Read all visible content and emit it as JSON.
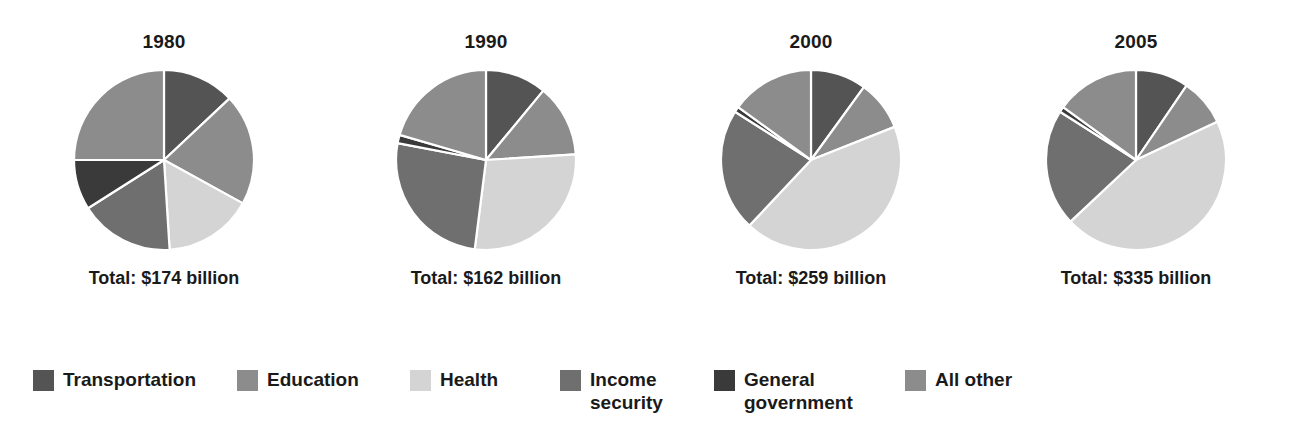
{
  "chart_data": {
    "type": "pie",
    "title": "",
    "subtitle": "",
    "xlabel": "",
    "ylabel": "",
    "legend_position": "bottom",
    "grid": false,
    "categories": [
      "Transportation",
      "Education",
      "Health",
      "Income security",
      "General government",
      "All other"
    ],
    "colors": [
      "#545454",
      "#8c8c8c",
      "#d4d4d4",
      "#6f6f6f",
      "#3a3a3a",
      "#8c8c8c"
    ],
    "panels": [
      {
        "year": "1980",
        "total_label": "Total: $174 billion",
        "total_value": 174,
        "total_units": "billion dollars",
        "values": [
          13.0,
          20.0,
          16.0,
          17.0,
          9.0,
          25.0
        ],
        "slices": [
          {
            "name": "Transportation",
            "percent": 13.0,
            "color": "#545454"
          },
          {
            "name": "Education",
            "percent": 20.0,
            "color": "#8c8c8c"
          },
          {
            "name": "Health",
            "percent": 16.0,
            "color": "#d4d4d4"
          },
          {
            "name": "Income security",
            "percent": 17.0,
            "color": "#6f6f6f"
          },
          {
            "name": "General government",
            "percent": 9.0,
            "color": "#3a3a3a"
          },
          {
            "name": "All other",
            "percent": 25.0,
            "color": "#8c8c8c"
          }
        ]
      },
      {
        "year": "1990",
        "total_label": "Total: $162 billion",
        "total_value": 162,
        "total_units": "billion dollars",
        "values": [
          11.0,
          13.0,
          28.0,
          26.0,
          1.5,
          20.5
        ],
        "slices": [
          {
            "name": "Transportation",
            "percent": 11.0,
            "color": "#545454"
          },
          {
            "name": "Education",
            "percent": 13.0,
            "color": "#8c8c8c"
          },
          {
            "name": "Health",
            "percent": 28.0,
            "color": "#d4d4d4"
          },
          {
            "name": "Income security",
            "percent": 26.0,
            "color": "#6f6f6f"
          },
          {
            "name": "General government",
            "percent": 1.5,
            "color": "#3a3a3a"
          },
          {
            "name": "All other",
            "percent": 20.5,
            "color": "#8c8c8c"
          }
        ]
      },
      {
        "year": "2000",
        "total_label": "Total: $259 billion",
        "total_value": 259,
        "total_units": "billion dollars",
        "values": [
          10.0,
          9.0,
          43.0,
          22.0,
          1.0,
          15.0
        ],
        "slices": [
          {
            "name": "Transportation",
            "percent": 10.0,
            "color": "#545454"
          },
          {
            "name": "Education",
            "percent": 9.0,
            "color": "#8c8c8c"
          },
          {
            "name": "Health",
            "percent": 43.0,
            "color": "#d4d4d4"
          },
          {
            "name": "Income security",
            "percent": 22.0,
            "color": "#6f6f6f"
          },
          {
            "name": "General government",
            "percent": 1.0,
            "color": "#3a3a3a"
          },
          {
            "name": "All other",
            "percent": 15.0,
            "color": "#8c8c8c"
          }
        ]
      },
      {
        "year": "2005",
        "total_label": "Total: $335 billion",
        "total_value": 335,
        "total_units": "billion dollars",
        "values": [
          9.5,
          8.5,
          45.0,
          21.0,
          1.0,
          15.0
        ],
        "slices": [
          {
            "name": "Transportation",
            "percent": 9.5,
            "color": "#545454"
          },
          {
            "name": "Education",
            "percent": 8.5,
            "color": "#8c8c8c"
          },
          {
            "name": "Health",
            "percent": 45.0,
            "color": "#d4d4d4"
          },
          {
            "name": "Income security",
            "percent": 21.0,
            "color": "#6f6f6f"
          },
          {
            "name": "General government",
            "percent": 1.0,
            "color": "#3a3a3a"
          },
          {
            "name": "All other",
            "percent": 15.0,
            "color": "#8c8c8c"
          }
        ]
      }
    ],
    "legend": [
      {
        "label": "Transportation",
        "color": "#545454",
        "x": 33
      },
      {
        "label": "Education",
        "color": "#8c8c8c",
        "x": 237
      },
      {
        "label": "Health",
        "color": "#d4d4d4",
        "x": 410
      },
      {
        "label": "Income\nsecurity",
        "color": "#6f6f6f",
        "x": 560
      },
      {
        "label": "General\ngovernment",
        "color": "#3a3a3a",
        "x": 714
      },
      {
        "label": "All other",
        "color": "#8c8c8c",
        "x": 905
      }
    ]
  },
  "style": {
    "background": "#ffffff",
    "text_color": "#1a1a1a",
    "slice_separator": "#ffffff",
    "panel_x": [
      0,
      322,
      647,
      972
    ]
  }
}
